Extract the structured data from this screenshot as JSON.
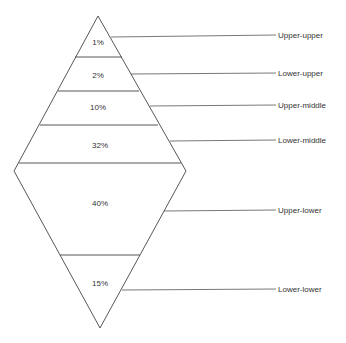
{
  "diagram": {
    "type": "social-class-diamond",
    "strata": [
      {
        "name": "Upper-upper",
        "percent": "1%"
      },
      {
        "name": "Lower-upper",
        "percent": "2%"
      },
      {
        "name": "Upper-middle",
        "percent": "10%"
      },
      {
        "name": "Lower-middle",
        "percent": "32%"
      },
      {
        "name": "Upper-lower",
        "percent": "40%"
      },
      {
        "name": "Lower-lower",
        "percent": "15%"
      }
    ]
  }
}
